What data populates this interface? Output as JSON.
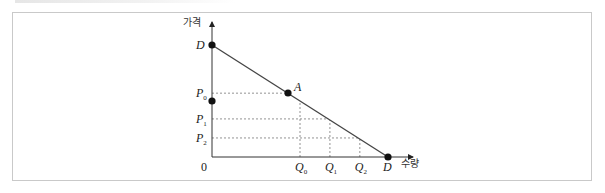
{
  "chart_data": {
    "type": "line",
    "title": "",
    "xlabel": "수량",
    "ylabel": "가격",
    "origin_label": "0",
    "curve": {
      "name": "D",
      "start_label": "D",
      "end_label": "D",
      "points": [
        [
          0,
          1.0
        ],
        [
          1.0,
          0
        ]
      ]
    },
    "point_A": {
      "label": "A",
      "q": 0.43,
      "p": 0.57
    },
    "price_levels": [
      {
        "label": "P",
        "sub": "0",
        "value": 0.57
      },
      {
        "label": "P",
        "sub": "1",
        "value": 0.34
      },
      {
        "label": "P",
        "sub": "2",
        "value": 0.17
      }
    ],
    "quantity_levels": [
      {
        "label": "Q",
        "sub": "0",
        "value": 0.5
      },
      {
        "label": "Q",
        "sub": "1",
        "value": 0.67
      },
      {
        "label": "Q",
        "sub": "2",
        "value": 0.84
      }
    ],
    "grid": false,
    "legend": "none"
  }
}
